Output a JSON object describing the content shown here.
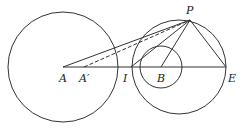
{
  "diagram": {
    "colors": {
      "stroke": "#333333",
      "background": "#ffffff"
    },
    "points": {
      "A": {
        "label": "A",
        "x": 63,
        "y": 67
      },
      "A_prime": {
        "label": "A′",
        "x": 84,
        "y": 67
      },
      "I": {
        "label": "I",
        "x": 131,
        "y": 67
      },
      "B": {
        "label": "B",
        "x": 161,
        "y": 67
      },
      "E": {
        "label": "E",
        "x": 226,
        "y": 67
      },
      "P": {
        "label": "P",
        "x": 190,
        "y": 20
      }
    },
    "circles": [
      {
        "name": "circle-A",
        "cx": 63,
        "cy": 67,
        "r": 55
      },
      {
        "name": "circle-IE",
        "cx": 179,
        "cy": 67,
        "r": 47
      },
      {
        "name": "circle-B",
        "cx": 161,
        "cy": 67,
        "r": 21
      }
    ],
    "segments": [
      {
        "name": "AE",
        "from": "A",
        "to": "E",
        "style": "solid"
      },
      {
        "name": "AP",
        "from": "A",
        "to": "P",
        "style": "solid"
      },
      {
        "name": "A'P",
        "from": "A_prime",
        "to": "P",
        "style": "dashed"
      },
      {
        "name": "IP",
        "from": "I",
        "to": "P",
        "style": "solid"
      },
      {
        "name": "BP",
        "from": "B",
        "to": "P",
        "style": "solid"
      },
      {
        "name": "PE",
        "from": "P",
        "to": "E",
        "style": "solid"
      }
    ]
  }
}
